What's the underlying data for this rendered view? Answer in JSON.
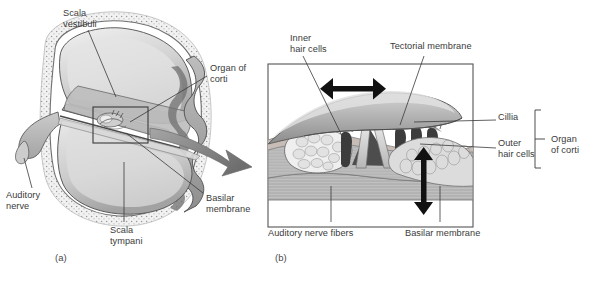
{
  "figure": {
    "panels": [
      {
        "id": "a",
        "mark": "(a)",
        "caption": "Cochlea cross section"
      },
      {
        "id": "b",
        "mark": "(b)",
        "caption": "Organ of Corti detail"
      }
    ]
  },
  "panel_a": {
    "labels": [
      {
        "name": "scala-vestibuli",
        "text": "Scala\nvestibuli",
        "x": 63,
        "y": 8,
        "align": "left"
      },
      {
        "name": "organ-of-corti",
        "text": "Organ of\ncorti",
        "x": 210,
        "y": 63,
        "align": "left"
      },
      {
        "name": "basilar-membrane",
        "text": "Basilar\nmembrane",
        "x": 206,
        "y": 193,
        "align": "left"
      },
      {
        "name": "scala-tympani",
        "text": "Scala\ntympani",
        "x": 110,
        "y": 225,
        "align": "left"
      },
      {
        "name": "auditory-nerve",
        "text": "Auditory\nnerve",
        "x": 6,
        "y": 190,
        "align": "left"
      }
    ],
    "panel_mark": "(a)",
    "panel_mark_x": 55,
    "panel_mark_y": 252
  },
  "panel_b": {
    "labels": [
      {
        "name": "inner-hair-cells",
        "text": "Inner\nhair cells",
        "x": 290,
        "y": 33,
        "align": "left"
      },
      {
        "name": "tectorial-membrane",
        "text": "Tectorial membrane",
        "x": 390,
        "y": 41,
        "align": "left"
      },
      {
        "name": "cillia",
        "text": "Cillia",
        "x": 498,
        "y": 117,
        "align": "left"
      },
      {
        "name": "outer-hair-cells",
        "text": "Outer\nhair cells",
        "x": 498,
        "y": 142,
        "align": "left"
      },
      {
        "name": "organ-of-corti-bracket",
        "text": "Organ\nof corti",
        "x": 551,
        "y": 142,
        "align": "left"
      },
      {
        "name": "auditory-nerve-fibers",
        "text": "Auditory nerve fibers",
        "x": 268,
        "y": 228,
        "align": "left"
      },
      {
        "name": "basilar-membrane-detail",
        "text": "Basilar membrane",
        "x": 405,
        "y": 228,
        "align": "left"
      }
    ],
    "panel_mark": "(b)",
    "panel_mark_x": 275,
    "panel_mark_y": 252
  },
  "colors": {
    "line": "#3a3a3a",
    "text": "#3a3a3a",
    "box_border": "#555555",
    "arrow_fill": "#8d8d8d",
    "tissue_light": "#d8d8d8",
    "tissue_mid": "#b4b4b4",
    "tissue_dark": "#8a8a8a",
    "tissue_darker": "#606060",
    "fluid": "#cfcfcf",
    "background": "#ffffff"
  }
}
